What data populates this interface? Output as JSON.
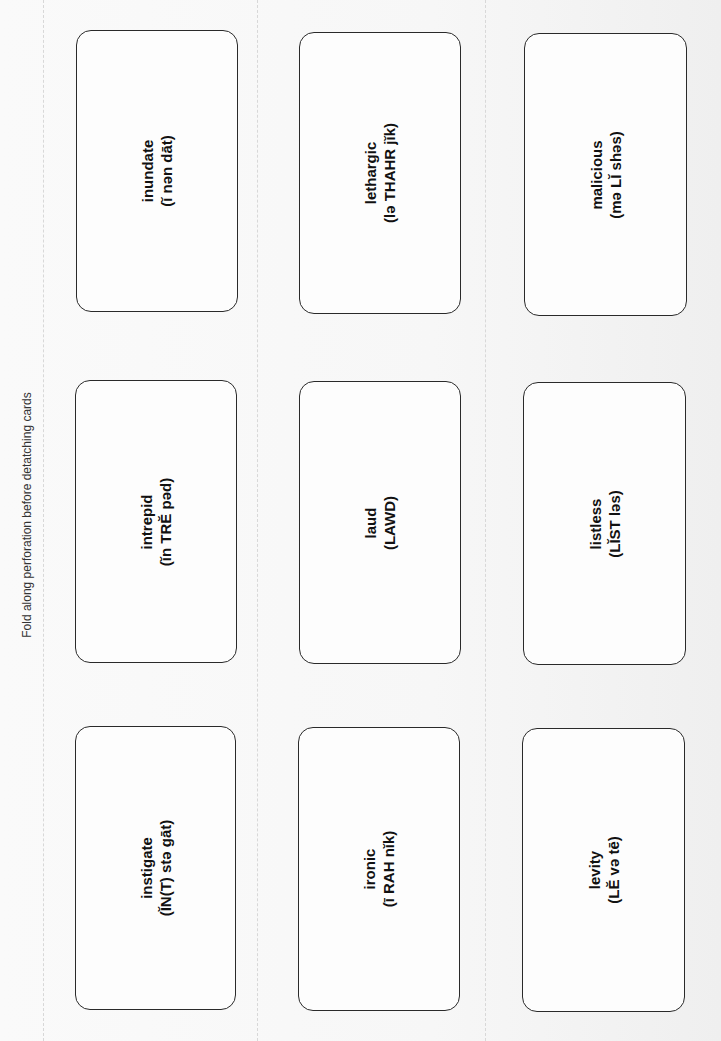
{
  "header": {
    "instruction": "Fold along perforation before detatching cards"
  },
  "cards": [
    {
      "word": "inundate",
      "pronunciation": "(ĭ nən dāt)"
    },
    {
      "word": "lethargic",
      "pronunciation": "(lə THAHR jĭk)"
    },
    {
      "word": "malicious",
      "pronunciation": "(mə LĬ shəs)"
    },
    {
      "word": "intrepid",
      "pronunciation": "(ĭn TRĔ pəd)"
    },
    {
      "word": "laud",
      "pronunciation": "(LAWD)"
    },
    {
      "word": "listless",
      "pronunciation": "(LĬST ləs)"
    },
    {
      "word": "instigate",
      "pronunciation": "(ĬN(T) stə gāt)"
    },
    {
      "word": "ironic",
      "pronunciation": "(ī RAH nĭk)"
    },
    {
      "word": "levity",
      "pronunciation": "(LĔ və tē)"
    }
  ],
  "colors": {
    "paper": "#f6f6f6",
    "card_border": "#2a2a2a",
    "text": "#111111",
    "perforation": "#d8d8d8"
  }
}
